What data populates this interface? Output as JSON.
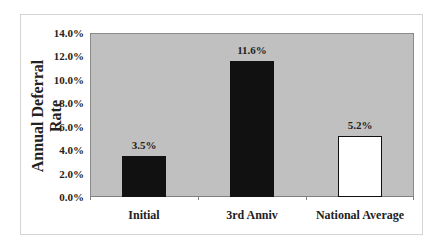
{
  "chart_data": {
    "type": "bar",
    "title": "",
    "xlabel": "",
    "ylabel": "Annual Deferral Rate",
    "ylim": [
      0,
      14
    ],
    "yticks": [
      "0.0%",
      "2.0%",
      "4.0%",
      "6.0%",
      "8.0%",
      "10.0%",
      "12.0%",
      "14.0%"
    ],
    "categories": [
      "Initial",
      "3rd Anniv",
      "National Average"
    ],
    "values": [
      3.5,
      11.6,
      5.2
    ],
    "data_labels": [
      "3.5%",
      "11.6%",
      "5.2%"
    ],
    "bar_colors": [
      "#111111",
      "#111111",
      "#ffffff"
    ],
    "plot_background": "#c0c0c0",
    "grid": false,
    "legend": "none"
  },
  "ylabel_line1": "Annual Deferral",
  "ylabel_line2": "Rate"
}
